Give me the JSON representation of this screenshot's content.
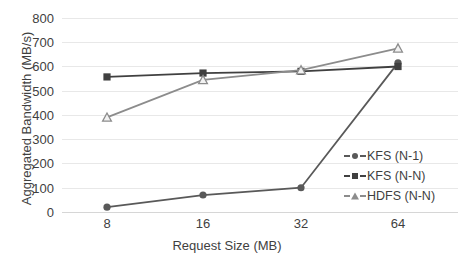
{
  "chart_data": {
    "type": "line",
    "title": "",
    "xlabel": "Request Size (MB)",
    "ylabel": "Aggregated Bandwidth (MB/s)",
    "categories": [
      "8",
      "16",
      "32",
      "64"
    ],
    "x": [
      8,
      16,
      32,
      64
    ],
    "ylim": [
      0,
      800
    ],
    "yticks": [
      0,
      100,
      200,
      300,
      400,
      500,
      600,
      700,
      800
    ],
    "ytick_labels": [
      "0",
      "100",
      "200",
      "300",
      "400",
      "500",
      "600",
      "700",
      "800"
    ],
    "grid": true,
    "legend_position": "right-center",
    "series": [
      {
        "name": "KFS (N-1)",
        "marker": "circle",
        "color": "#595959",
        "values": [
          20,
          70,
          100,
          615
        ]
      },
      {
        "name": "KFS (N-N)",
        "marker": "square",
        "color": "#404040",
        "values": [
          557,
          573,
          580,
          600
        ]
      },
      {
        "name": "HDFS (N-N)",
        "marker": "triangle",
        "color": "#8c8c8c",
        "values": [
          390,
          545,
          585,
          675
        ]
      }
    ]
  },
  "axes": {
    "y_title": "Aggregated Bandwidth (MB/s)",
    "x_title": "Request Size (MB)",
    "y_labels": [
      "800",
      "700",
      "600",
      "500",
      "400",
      "300",
      "200",
      "100",
      "0"
    ],
    "x_labels": [
      "8",
      "16",
      "32",
      "64"
    ]
  },
  "legend": {
    "items": [
      {
        "label": "KFS (N-1)",
        "marker": "circle-marker",
        "color": "#595959"
      },
      {
        "label": "KFS (N-N)",
        "marker": "square-marker",
        "color": "#404040"
      },
      {
        "label": "HDFS (N-N)",
        "marker": "triangle-marker",
        "color": "#8c8c8c"
      }
    ]
  },
  "colors": {
    "gridline": "#e8e8e8",
    "baseline": "#d6d6d6",
    "text": "#3f3f3f",
    "background": "#ffffff"
  }
}
